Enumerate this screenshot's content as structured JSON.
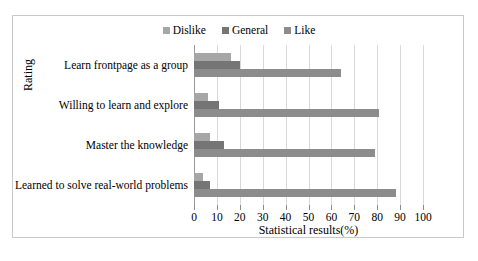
{
  "chart_data": {
    "type": "bar",
    "orientation": "horizontal",
    "title": "",
    "xlabel": "Statistical results(%)",
    "ylabel": "Rating",
    "xlim": [
      0,
      100
    ],
    "xticks": [
      0,
      10,
      20,
      30,
      40,
      50,
      60,
      70,
      80,
      90,
      100
    ],
    "grid": true,
    "legend_position": "top-center",
    "categories": [
      "Learn frontpage as a group",
      "Willing to learn and explore",
      "Master the knowledge",
      "Learned to solve real-world problems"
    ],
    "series": [
      {
        "name": "Dislike",
        "color": "#a6a6a6",
        "values": [
          16,
          6,
          7,
          4
        ]
      },
      {
        "name": "General",
        "color": "#757575",
        "values": [
          20,
          11,
          13,
          7
        ]
      },
      {
        "name": "Like",
        "color": "#8c8c8c",
        "values": [
          64,
          81,
          79,
          88
        ]
      }
    ]
  },
  "legend": {
    "items": [
      {
        "label": "Dislike",
        "color": "#a6a6a6"
      },
      {
        "label": "General",
        "color": "#757575"
      },
      {
        "label": "Like",
        "color": "#8c8c8c"
      }
    ]
  },
  "axes": {
    "x_title": "Statistical results(%)",
    "y_title": "Rating",
    "x_tick_labels": [
      "0",
      "10",
      "20",
      "30",
      "40",
      "50",
      "60",
      "70",
      "80",
      "90",
      "100"
    ],
    "y_tick_labels": [
      "Learn frontpage as a group",
      "Willing to learn and explore",
      "Master the knowledge",
      "Learned to solve real-world problems"
    ]
  }
}
